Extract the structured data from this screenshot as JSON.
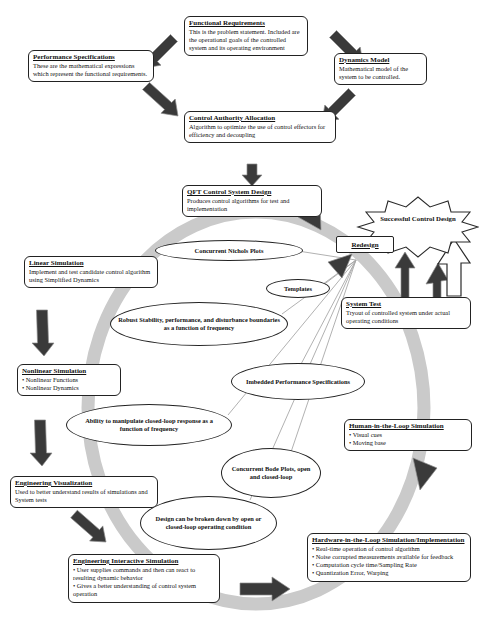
{
  "colors": {
    "ring": "#cacaca",
    "arrow_dark": "#3a3a3a",
    "feedback_line": "#a8a8a8",
    "border": "#222222"
  },
  "boxes": {
    "functional_requirements": {
      "title": "Functional Requirements",
      "body": "This is the problem statement. Included are the operational goals of the controlled system and its operating environment"
    },
    "performance_specifications": {
      "title": "Performance Specifications",
      "body": "These are the mathematical expressions which represent the functional requirements."
    },
    "dynamics_model": {
      "title": "Dynamics Model",
      "body": "Mathematical model of the system to be controlled."
    },
    "control_authority_allocation": {
      "title": "Control Authority Allocation",
      "body": "Algorithm to optimize the use of control effectors for efficiency and decoupling"
    },
    "qft_control_system_design": {
      "title": "QFT Control System Design",
      "body": "Produces control algorithms for test and implementation"
    },
    "redesign": {
      "title": "Redesign"
    },
    "linear_simulation": {
      "title": "Linear Simulation",
      "body": "Implement and test candidate control algorithm using Simplified Dynamics"
    },
    "system_test": {
      "title": "System Test",
      "body": "Tryout of controlled system under actual operating conditions"
    },
    "nonlinear_simulation": {
      "title": "Nonlinear Simulation",
      "bullets": [
        "Nonlinear Functions",
        "Nonlinear Dynamics"
      ]
    },
    "human_in_the_loop": {
      "title": "Human-in-the-Loop Simulation",
      "bullets": [
        "Visual cues",
        "Moving base"
      ]
    },
    "engineering_visualization": {
      "title": "Engineering Visualization",
      "body": "Used to better understand results of simulations and System tests"
    },
    "engineering_interactive_simulation": {
      "title": "Engineering Interactive Simulation",
      "bullets": [
        "User supplies commands and then can react to resulting dynamic behavior",
        "Gives a better understanding of control system operation"
      ]
    },
    "hardware_in_the_loop": {
      "title": "Hardware-in-the-Loop Simulation/Implementation",
      "bullets": [
        "Real-time operation of control algorithm",
        "Noise corrupted measurements available for feedback",
        "Computation cycle time/Sampling Rate",
        "Quantization Error, Warping"
      ]
    }
  },
  "ellipses": {
    "concurrent_nichols_plots": {
      "label": "Concurrent Nichols Plots"
    },
    "templates": {
      "label": "Templates"
    },
    "robust_stability": {
      "label": "Robust Stability, performance, and disturbance boundaries as a function of frequency"
    },
    "imbedded_performance_specifications": {
      "label": "Imbedded Performance Specifications"
    },
    "ability_to_manipulate": {
      "label": "Ability to manipulate closed-loop response as a function of frequency"
    },
    "concurrent_bode_plots": {
      "label": "Concurrent Bode Plots, open and closed-loop"
    },
    "design_breakdown": {
      "label": "Design can be broken down by open or closed-loop operating condition"
    }
  },
  "starburst": {
    "label": "Successful Control Design"
  }
}
